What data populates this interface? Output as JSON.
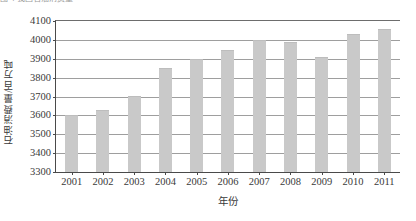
{
  "top_strip": {
    "clipped_text": "图 4 我国石油消费量"
  },
  "chart_data": {
    "type": "bar",
    "title": "",
    "xlabel": "年份",
    "ylabel": "石油消费量/百万吨",
    "categories": [
      "2001",
      "2002",
      "2003",
      "2004",
      "2005",
      "2006",
      "2007",
      "2008",
      "2009",
      "2010",
      "2011"
    ],
    "values": [
      3600,
      3630,
      3700,
      3850,
      3900,
      3945,
      4000,
      3987,
      3910,
      4033,
      4055
    ],
    "ylim": [
      3300,
      4100
    ],
    "ytick_step": 100,
    "yticks": [
      "4100",
      "4000",
      "3900",
      "3800",
      "3700",
      "3600",
      "3500",
      "3400",
      "3300"
    ],
    "grid": true,
    "legend": "none",
    "bar_color": "#c9c9c9",
    "axis_color": "#4a4a4a",
    "grid_color": "#9e9e9e"
  }
}
